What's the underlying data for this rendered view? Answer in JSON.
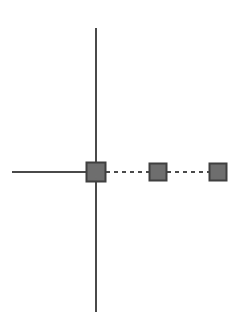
{
  "canvas": {
    "width": 231,
    "height": 320,
    "background": "#ffffff",
    "title": "Node chain on axis"
  },
  "style": {
    "line_color": "#4a4a4a",
    "node_fill": "#6e6e6e",
    "node_stroke": "#3f3f3f",
    "solid_width": 2,
    "dashed_width": 2,
    "dash_pattern": "4,4"
  },
  "axes": {
    "vertical": {
      "label": "vertical-axis",
      "x": 96,
      "y1": 28,
      "y2": 312,
      "stroke": "#4a4a4a",
      "width": 2,
      "style": "solid"
    },
    "horizontal": {
      "label": "horizontal-axis",
      "y": 172,
      "x1": 12,
      "x2": 96,
      "stroke": "#4a4a4a",
      "width": 2,
      "style": "solid"
    }
  },
  "nodes": [
    {
      "id": "node-1",
      "label": "",
      "cx": 96,
      "cy": 172,
      "size": 19,
      "fill": "#6e6e6e",
      "stroke": "#3f3f3f"
    },
    {
      "id": "node-2",
      "label": "",
      "cx": 158,
      "cy": 172,
      "size": 17,
      "fill": "#6e6e6e",
      "stroke": "#3f3f3f"
    },
    {
      "id": "node-3",
      "label": "",
      "cx": 218,
      "cy": 172,
      "size": 17,
      "fill": "#6e6e6e",
      "stroke": "#3f3f3f"
    }
  ],
  "connectors": [
    {
      "id": "connector-1-2",
      "from": "node-1",
      "to": "node-2",
      "x1": 106,
      "x2": 150,
      "y": 172,
      "stroke": "#4a4a4a",
      "width": 2,
      "style": "dashed",
      "dash_pattern": "4,4"
    },
    {
      "id": "connector-2-3",
      "from": "node-2",
      "to": "node-3",
      "x1": 167,
      "x2": 210,
      "y": 172,
      "stroke": "#4a4a4a",
      "width": 2,
      "style": "dashed",
      "dash_pattern": "4,4"
    }
  ]
}
